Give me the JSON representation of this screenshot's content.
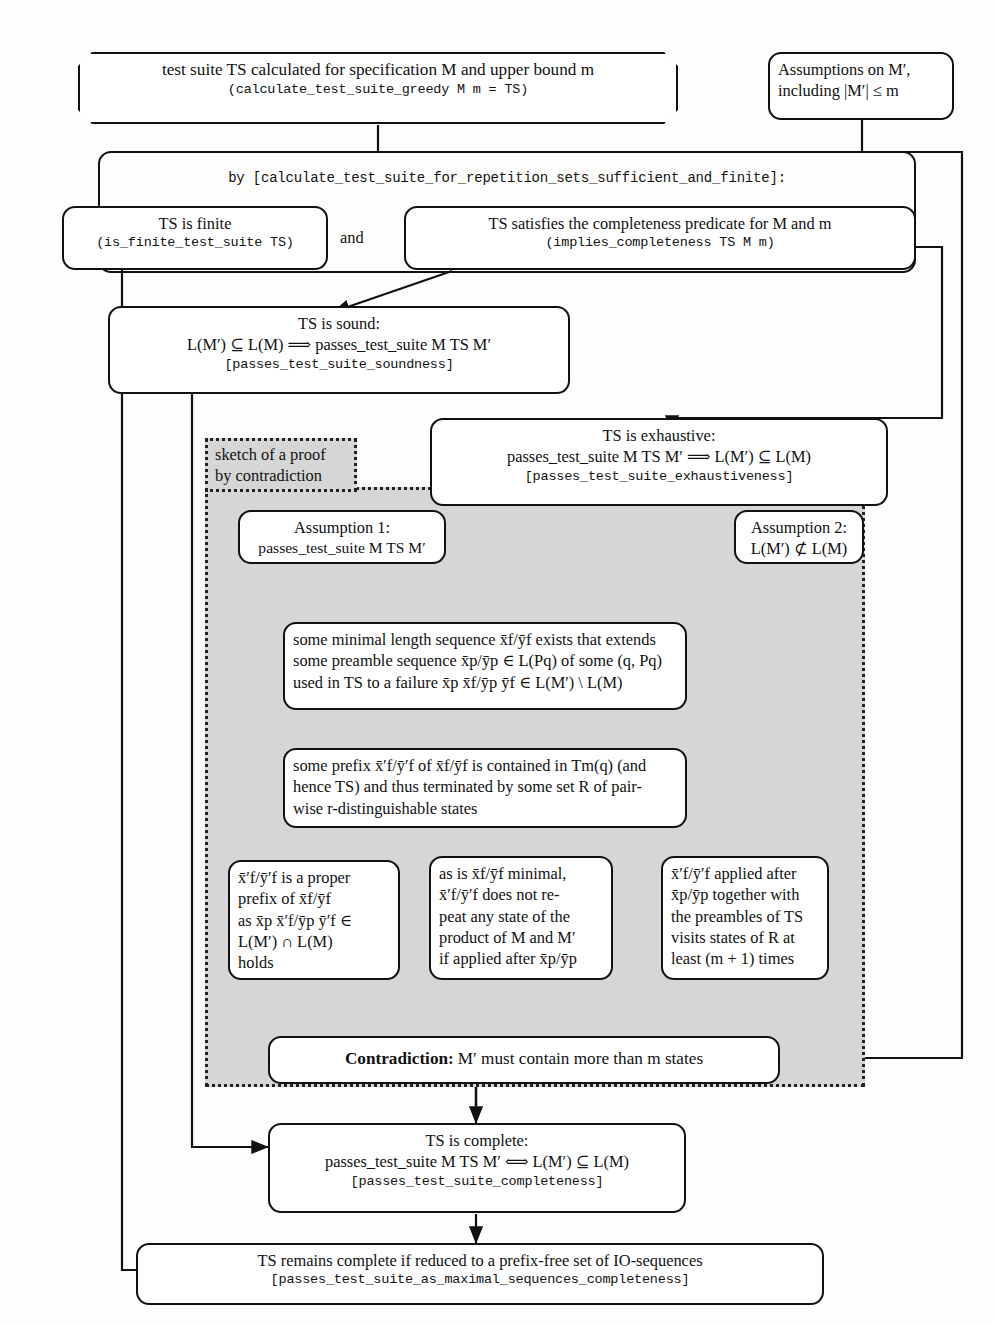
{
  "figure": {
    "caption_prefix": "Fig. 1.",
    "caption": "Overview of the overall result"
  },
  "nodes": {
    "top_suite": {
      "line1": "test suite TS calculated for specification M and upper bound m",
      "line2": "(calculate_test_suite_greedy M m = TS)"
    },
    "assumptions": {
      "line1": "Assumptions on M′,",
      "line2": "including |M′| ≤ m"
    },
    "by_rule": {
      "label": "by [calculate_test_suite_for_repetition_sets_sufficient_and_finite]:"
    },
    "finite": {
      "line1": "TS is finite",
      "line2": "(is_finite_test_suite TS)"
    },
    "and_label": "and",
    "completeness_predicate": {
      "line1": "TS satisfies the completeness predicate for M and m",
      "line2": "(implies_completeness TS M m)"
    },
    "sound": {
      "line1": "TS is sound:",
      "line2": "L(M′) ⊆ L(M) ⟹ passes_test_suite M TS M′",
      "line3": "[passes_test_suite_soundness]"
    },
    "exhaustive": {
      "line1": "TS is exhaustive:",
      "line2": "passes_test_suite M TS M′ ⟹ L(M′) ⊆ L(M)",
      "line3": "[passes_test_suite_exhaustiveness]"
    },
    "sketch": {
      "line1": "sketch of a proof",
      "line2": "by contradiction"
    },
    "assumption1": {
      "line1": "Assumption 1:",
      "line2": "passes_test_suite M TS M′"
    },
    "assumption2": {
      "line1": "Assumption 2:",
      "line2": "L(M′) ⊄ L(M)"
    },
    "minimal_seq": {
      "line1": "some minimal length sequence x̄f/ȳf exists that extends",
      "line2": "some preamble sequence x̄p/ȳp ∈ L(Pq) of some (q, Pq)",
      "line3": "used in TS to a failure x̄p x̄f/ȳp ȳf ∈ L(M′) \\ L(M)"
    },
    "some_prefix": {
      "line1": "some prefix x̄′f/ȳ′f of x̄f/ȳf is contained in Tm(q) (and",
      "line2": "hence TS) and thus terminated by some set R of pair-",
      "line3": "wise r-distinguishable states"
    },
    "proper_prefix": {
      "line1": "x̄′f/ȳ′f is a proper",
      "line2": "prefix of x̄f/ȳf",
      "line3": "as x̄p x̄′f/ȳp ȳ′f ∈",
      "line4": "L(M′) ∩ L(M)",
      "line5": "holds"
    },
    "minimal_no_repeat": {
      "line1": "as is x̄f/ȳf minimal,",
      "line2": "x̄′f/ȳ′f does not re-",
      "line3": "peat any state of the",
      "line4": "product of M and M′",
      "line5": "if applied after x̄p/ȳp"
    },
    "visits_states": {
      "line1": "x̄′f/ȳ′f applied after",
      "line2": "x̄p/ȳp together with",
      "line3": "the preambles of TS",
      "line4": "visits states of R at",
      "line5": "least (m + 1) times"
    },
    "contradiction": {
      "bold": "Contradiction:",
      "rest": "M′ must contain more than m states"
    },
    "complete": {
      "line1": "TS is complete:",
      "line2": "passes_test_suite M TS M′ ⟺ L(M′) ⊆ L(M)",
      "line3": "[passes_test_suite_completeness]"
    },
    "remains_complete": {
      "line1": "TS remains complete if reduced to a prefix-free set of IO-sequences",
      "line2": "[passes_test_suite_as_maximal_sequences_completeness]"
    }
  },
  "colors": {
    "ink": "#111111",
    "paper": "#fdfdfb",
    "shade": "#d6d6d6"
  }
}
